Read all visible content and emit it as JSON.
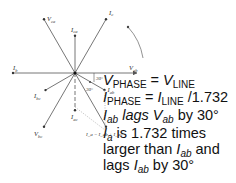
{
  "diagram": {
    "phasors": [
      {
        "id": "V_ca",
        "label": "V",
        "sub": "ca",
        "angle_deg": 120,
        "magnitude": 1.0,
        "style": "solid"
      },
      {
        "id": "I_ca",
        "label": "I",
        "sub": "ca",
        "angle_deg": 90,
        "magnitude": 0.6,
        "style": "solid"
      },
      {
        "id": "I_c",
        "label": "I",
        "sub": "c",
        "angle_deg": 60,
        "magnitude": 1.0,
        "style": "solid"
      },
      {
        "id": "I_b",
        "label": "I",
        "sub": "b",
        "angle_deg": 180,
        "magnitude": 1.0,
        "style": "solid"
      },
      {
        "id": "V_ab",
        "label": "V",
        "sub": "ab",
        "angle_deg": 0,
        "magnitude": 1.0,
        "style": "arrow"
      },
      {
        "id": "I_bc",
        "label": "I",
        "sub": "bc",
        "angle_deg": 210,
        "magnitude": 0.55,
        "style": "solid"
      },
      {
        "id": "I_ab",
        "label": "I",
        "sub": "ab",
        "angle_deg": -30,
        "magnitude": 0.55,
        "style": "solid"
      },
      {
        "id": "V_bc",
        "label": "V",
        "sub": "bc",
        "angle_deg": 240,
        "magnitude": 1.0,
        "style": "solid"
      },
      {
        "id": "I_a",
        "label": "I",
        "sub": "a",
        "angle_deg": -60,
        "magnitude": 1.0,
        "style": "solid"
      },
      {
        "id": "I_ac",
        "label": "I",
        "sub": "ac",
        "angle_deg": -90,
        "magnitude": 0.6,
        "style": "dashed"
      }
    ],
    "angle_labels": [
      "30°",
      "30°"
    ],
    "sum_label": "I_a = I_ab + I_ac"
  },
  "equations": [
    {
      "parts": [
        {
          "t": "V",
          "i": true
        },
        {
          "t": "PHASE",
          "sub": true
        },
        {
          "t": " = "
        },
        {
          "t": "V",
          "i": true
        },
        {
          "t": "LINE",
          "sub": true
        }
      ]
    },
    {
      "parts": [
        {
          "t": "I",
          "i": true
        },
        {
          "t": "PHASE",
          "sub": true
        },
        {
          "t": " = "
        },
        {
          "t": "I",
          "i": true
        },
        {
          "t": "LINE",
          "sub": true
        },
        {
          "t": " /1.732"
        }
      ]
    },
    {
      "parts": [
        {
          "t": "I",
          "i": true
        },
        {
          "t": "ab",
          "sub": true,
          "i": true
        },
        {
          "t": " lags ",
          "i": true
        },
        {
          "t": "V",
          "i": true
        },
        {
          "t": "ab",
          "sub": true,
          "i": true
        },
        {
          "t": " by 30°"
        }
      ]
    },
    {
      "parts": [
        {
          "t": "I",
          "i": true
        },
        {
          "t": "a",
          "sub": true,
          "i": true
        },
        {
          "t": " is 1.732 times"
        }
      ]
    },
    {
      "parts": [
        {
          "t": "larger than "
        },
        {
          "t": "I",
          "i": true
        },
        {
          "t": "ab",
          "sub": true,
          "i": true
        },
        {
          "t": " and"
        }
      ]
    },
    {
      "parts": [
        {
          "t": "lags "
        },
        {
          "t": "I",
          "i": true
        },
        {
          "t": "ab",
          "sub": true,
          "i": true
        },
        {
          "t": " by 30°"
        }
      ]
    }
  ]
}
